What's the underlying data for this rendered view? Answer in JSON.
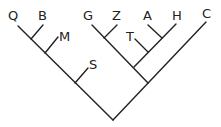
{
  "diagram": {
    "type": "cladogram",
    "taxa": [
      {
        "label": "Q",
        "x": 13,
        "y": 21
      },
      {
        "label": "B",
        "x": 42,
        "y": 21
      },
      {
        "label": "M",
        "x": 60,
        "y": 41
      },
      {
        "label": "S",
        "x": 91,
        "y": 69
      },
      {
        "label": "G",
        "x": 84,
        "y": 21
      },
      {
        "label": "Z",
        "x": 113,
        "y": 21
      },
      {
        "label": "T",
        "x": 125,
        "y": 41
      },
      {
        "label": "A",
        "x": 144,
        "y": 21
      },
      {
        "label": "H",
        "x": 172,
        "y": 21
      },
      {
        "label": "C",
        "x": 202,
        "y": 19
      }
    ],
    "newick": "(((((Q,B),M),S),(((G,Z),(T,(A,H))))),C)",
    "line_color": "#222222",
    "background": "#ffffff"
  }
}
